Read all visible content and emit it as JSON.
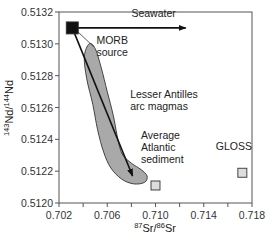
{
  "chart_data": {
    "type": "scatter",
    "title": "",
    "xlabel": {
      "sup1": "87",
      "base1": "Sr/",
      "sup2": "86",
      "base2": "Sr"
    },
    "ylabel": {
      "sup1": "143",
      "base1": "Nd/",
      "sup2": "144",
      "base2": "Nd"
    },
    "xlim": [
      0.702,
      0.718
    ],
    "ylim": [
      0.512,
      0.5132
    ],
    "x_ticks": [
      0.702,
      0.704,
      0.706,
      0.708,
      0.71,
      0.712,
      0.714,
      0.716,
      0.718
    ],
    "x_tick_labels": [
      "0.702",
      "",
      "0.706",
      "",
      "0.710",
      "",
      "0.714",
      "",
      "0.718"
    ],
    "y_ticks": [
      0.512,
      0.5122,
      0.5124,
      0.5126,
      0.5128,
      0.513,
      0.5132
    ],
    "y_tick_labels": [
      "0.5120",
      "0.5122",
      "0.5124",
      "0.5126",
      "0.5128",
      "0.5130",
      "0.5132"
    ],
    "grid": false,
    "points": [
      {
        "name": "MORB source",
        "x": 0.7031,
        "y": 0.5131,
        "marker": "square",
        "fill": "#111111"
      },
      {
        "name": "Average Atlantic sediment",
        "x": 0.71,
        "y": 0.51211,
        "marker": "square",
        "fill": "#dddddd"
      },
      {
        "name": "GLOSS",
        "x": 0.7172,
        "y": 0.51219,
        "marker": "square",
        "fill": "#dddddd"
      }
    ],
    "field": {
      "name": "Lesser Antilles arc magmas",
      "fill": "#a9a9a9",
      "outline": [
        [
          0.7045,
          0.513
        ],
        [
          0.705,
          0.51297
        ],
        [
          0.7055,
          0.51285
        ],
        [
          0.706,
          0.5127
        ],
        [
          0.7065,
          0.51255
        ],
        [
          0.7068,
          0.51243
        ],
        [
          0.707,
          0.51236
        ],
        [
          0.7073,
          0.5123
        ],
        [
          0.708,
          0.51225
        ],
        [
          0.7088,
          0.51221
        ],
        [
          0.7093,
          0.51217
        ],
        [
          0.7091,
          0.51213
        ],
        [
          0.7082,
          0.51212
        ],
        [
          0.7072,
          0.51215
        ],
        [
          0.7063,
          0.51222
        ],
        [
          0.7057,
          0.51232
        ],
        [
          0.7052,
          0.51246
        ],
        [
          0.7048,
          0.51262
        ],
        [
          0.7043,
          0.51278
        ],
        [
          0.7041,
          0.51292
        ]
      ]
    },
    "lines": [
      {
        "name": "Seawater",
        "from": [
          0.7031,
          0.5131
        ],
        "to": [
          0.7125,
          0.5131
        ],
        "arrow": true
      },
      {
        "name": "mixing-line",
        "from": [
          0.7031,
          0.5131
        ],
        "to": [
          0.7081,
          0.51217
        ],
        "arrow": true
      }
    ],
    "annotations": [
      {
        "id": "seawater",
        "lines": [
          "Seawater"
        ],
        "x": 0.708,
        "y": 0.51317
      },
      {
        "id": "morb",
        "lines": [
          "MORB",
          "source"
        ],
        "x": 0.7051,
        "y": 0.513
      },
      {
        "id": "antilles",
        "lines": [
          "Lesser Antilles",
          "arc magmas"
        ],
        "x": 0.7079,
        "y": 0.51266
      },
      {
        "id": "atlantic",
        "lines": [
          "Average",
          "Atlantic",
          "sediment"
        ],
        "x": 0.7088,
        "y": 0.5124
      },
      {
        "id": "gloss",
        "lines": [
          "GLOSS"
        ],
        "x": 0.715,
        "y": 0.51233
      }
    ],
    "leader": {
      "from": [
        0.7035,
        0.51308
      ],
      "to": [
        0.7049,
        0.51298
      ]
    },
    "legend": null
  }
}
